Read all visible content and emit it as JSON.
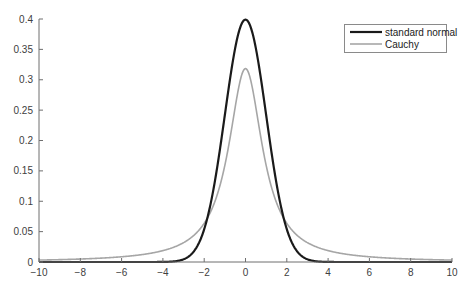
{
  "chart_data": {
    "type": "line",
    "title": "",
    "xlabel": "",
    "ylabel": "",
    "xlim": [
      -10,
      10
    ],
    "ylim": [
      0,
      0.4
    ],
    "grid": false,
    "box": false,
    "legend_position": "northeast",
    "x_ticks": [
      -10,
      -8,
      -6,
      -4,
      -2,
      0,
      2,
      4,
      6,
      8,
      10
    ],
    "x_tick_labels": [
      "−10",
      "−8",
      "−6",
      "−4",
      "−2",
      "0",
      "2",
      "4",
      "6",
      "8",
      "10"
    ],
    "y_ticks": [
      0,
      0.05,
      0.1,
      0.15,
      0.2,
      0.25,
      0.3,
      0.35,
      0.4
    ],
    "y_tick_labels": [
      "0",
      "0.05",
      "0.1",
      "0.15",
      "0.2",
      "0.25",
      "0.3",
      "0.35",
      "0.4"
    ],
    "x": [
      -10,
      -8,
      -6,
      -4,
      -3,
      -2,
      -1.5,
      -1,
      -0.5,
      0,
      0.5,
      1,
      1.5,
      2,
      3,
      4,
      6,
      8,
      10
    ],
    "series": [
      {
        "name": "standard normal",
        "color": "#1a1a1a",
        "line_width": 2.2,
        "formula": "normal_pdf",
        "values": [
          0.0,
          0.0,
          0.0,
          0.0001,
          0.0044,
          0.054,
          0.1295,
          0.242,
          0.3521,
          0.3989,
          0.3521,
          0.242,
          0.1295,
          0.054,
          0.0044,
          0.0001,
          0.0,
          0.0,
          0.0
        ]
      },
      {
        "name": "Cauchy",
        "color": "#a6a6a6",
        "line_width": 1.6,
        "formula": "cauchy_pdf",
        "values": [
          0.0032,
          0.0049,
          0.0086,
          0.0187,
          0.0318,
          0.0637,
          0.0979,
          0.1592,
          0.2546,
          0.3183,
          0.2546,
          0.1592,
          0.0979,
          0.0637,
          0.0318,
          0.0187,
          0.0086,
          0.0049,
          0.0032
        ]
      }
    ]
  },
  "legend": {
    "items": [
      {
        "label": "standard normal",
        "color": "#1a1a1a",
        "width": 2.2
      },
      {
        "label": "Cauchy",
        "color": "#a6a6a6",
        "width": 1.6
      }
    ]
  },
  "colors": {
    "axis": "#6e6e6e",
    "tick_text": "#404040",
    "legend_border": "#8a8a8a"
  }
}
